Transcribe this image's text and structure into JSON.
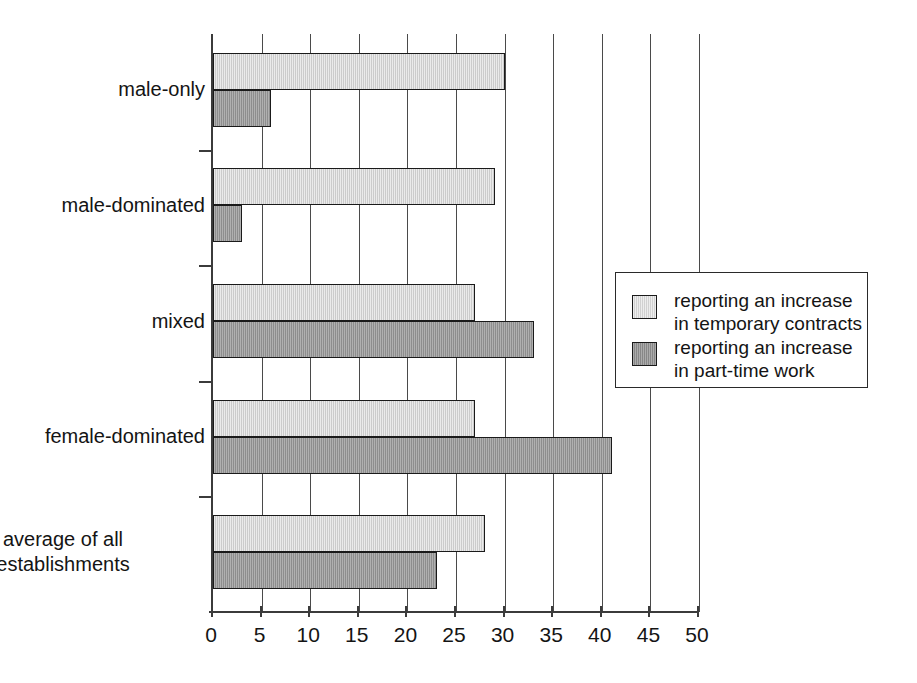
{
  "chart_data": {
    "type": "bar",
    "orientation": "horizontal",
    "title": "",
    "xlabel": "",
    "ylabel": "",
    "xlim": [
      0,
      50
    ],
    "xticks": [
      0,
      5,
      10,
      15,
      20,
      25,
      30,
      35,
      40,
      45,
      50
    ],
    "xtick_labels": [
      "0",
      "5",
      "10",
      "15",
      "20",
      "25",
      "30",
      "35",
      "40",
      "45",
      "50"
    ],
    "grid": "vertical",
    "categories": [
      "male-only",
      "male-dominated",
      "mixed",
      "female-dominated",
      "average of all\nestablishments"
    ],
    "series": [
      {
        "name": "reporting an increase\nin temporary contracts",
        "color": "#d2d2d2",
        "values": [
          30,
          29,
          27,
          27,
          28
        ]
      },
      {
        "name": "reporting an increase\nin part-time work",
        "color": "#969696",
        "values": [
          6,
          3,
          33,
          41,
          23
        ]
      }
    ],
    "legend": {
      "position": "middle-right",
      "entries": [
        {
          "label": "reporting an increase\nin temporary contracts",
          "color": "#d2d2d2"
        },
        {
          "label": "reporting an increase\nin part-time work",
          "color": "#969696"
        }
      ]
    },
    "colors": {
      "light_bar": "#d2d2d2",
      "dark_bar": "#969696",
      "axis": "#3b3b3b",
      "gridline": "#4a4a4a",
      "text": "#141414",
      "background": "#ffffff"
    }
  }
}
